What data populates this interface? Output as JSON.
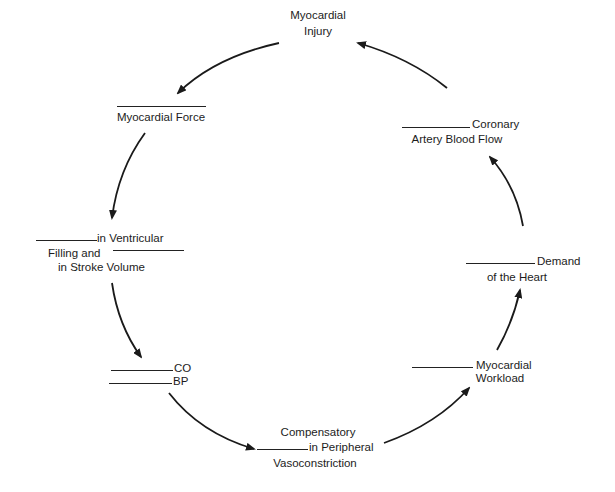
{
  "diagram": {
    "type": "cycle",
    "title": "",
    "nodes": [
      {
        "id": "injury",
        "lines": [
          "Myocardial",
          "Injury"
        ]
      },
      {
        "id": "force",
        "blank_before": true,
        "lines": [
          "Myocardial Force"
        ]
      },
      {
        "id": "ventricular",
        "line1": "in Ventricular",
        "line2": "Filling and",
        "line3": "in Stroke Volume"
      },
      {
        "id": "co_bp",
        "co": "CO",
        "bp": "BP"
      },
      {
        "id": "compensatory",
        "line1": "Compensatory",
        "line2": "in Peripheral",
        "line3": "Vasoconstriction"
      },
      {
        "id": "workload",
        "line1": "Myocardial",
        "line2": "Workload"
      },
      {
        "id": "demand",
        "line1": "Demand",
        "line2": "of the Heart"
      },
      {
        "id": "coronary",
        "line1": "Coronary",
        "line2": "Artery Blood Flow"
      }
    ],
    "edges": [
      {
        "from": "injury",
        "to": "force"
      },
      {
        "from": "force",
        "to": "ventricular"
      },
      {
        "from": "ventricular",
        "to": "co_bp"
      },
      {
        "from": "co_bp",
        "to": "compensatory"
      },
      {
        "from": "compensatory",
        "to": "workload"
      },
      {
        "from": "workload",
        "to": "demand"
      },
      {
        "from": "demand",
        "to": "coronary"
      },
      {
        "from": "coronary",
        "to": "injury"
      }
    ],
    "colors": {
      "ink": "#1a1a1a",
      "background": "#ffffff"
    }
  }
}
